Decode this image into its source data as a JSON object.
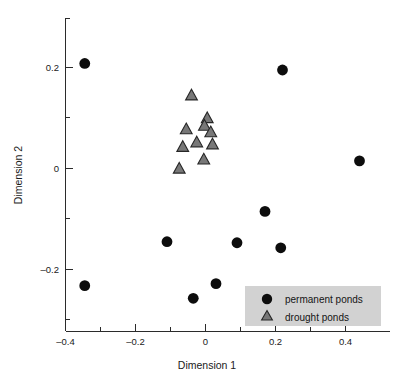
{
  "chart_data": {
    "type": "scatter",
    "title": "",
    "xlabel": "Dimension 1",
    "ylabel": "Dimension 2",
    "xlim": [
      -0.47,
      0.5
    ],
    "ylim": [
      -0.3,
      0.26
    ],
    "grid": false,
    "legend_position": "bottom-right",
    "xticks": [
      -0.4,
      -0.2,
      0,
      0.2,
      0.4
    ],
    "xtick_labels": [
      "–0.4",
      "–0.2",
      "0",
      "0.2",
      "0.4"
    ],
    "yticks": [
      0.2,
      0,
      -0.2
    ],
    "ytick_labels": [
      "0.2",
      "0",
      "–0.2"
    ],
    "x_minor_ticks": [
      -0.3,
      -0.1,
      0.1,
      0.3
    ],
    "y_minor_ticks": [
      0.1,
      -0.1
    ],
    "series": [
      {
        "name": "permanent ponds",
        "marker": "circle",
        "color": "#0d0d0d",
        "points": [
          {
            "x": -0.345,
            "y": 0.208
          },
          {
            "x": 0.22,
            "y": 0.195
          },
          {
            "x": 0.44,
            "y": 0.015
          },
          {
            "x": 0.17,
            "y": -0.085
          },
          {
            "x": -0.11,
            "y": -0.145
          },
          {
            "x": 0.09,
            "y": -0.147
          },
          {
            "x": 0.215,
            "y": -0.157
          },
          {
            "x": -0.345,
            "y": -0.232
          },
          {
            "x": 0.03,
            "y": -0.228
          },
          {
            "x": -0.035,
            "y": -0.257
          }
        ]
      },
      {
        "name": "drought ponds",
        "marker": "triangle",
        "color": "#787878",
        "points": [
          {
            "x": -0.04,
            "y": 0.145
          },
          {
            "x": 0.005,
            "y": 0.1
          },
          {
            "x": -0.003,
            "y": 0.085
          },
          {
            "x": -0.055,
            "y": 0.078
          },
          {
            "x": 0.015,
            "y": 0.072
          },
          {
            "x": -0.025,
            "y": 0.052
          },
          {
            "x": 0.02,
            "y": 0.048
          },
          {
            "x": -0.065,
            "y": 0.043
          },
          {
            "x": -0.005,
            "y": 0.018
          },
          {
            "x": -0.075,
            "y": 0.0
          }
        ]
      }
    ]
  },
  "legend": {
    "items": [
      {
        "label": "permanent ponds",
        "marker": "circle"
      },
      {
        "label": "drought ponds",
        "marker": "triangle"
      }
    ]
  },
  "colors": {
    "circle_fill": "#0d0d0d",
    "triangle_fill": "#787878",
    "triangle_stroke": "#262626",
    "axis": "#2b2b2b",
    "legend_background": "#d2d2d2",
    "text": "#1a1a1a",
    "plot_background": "#ffffff"
  }
}
